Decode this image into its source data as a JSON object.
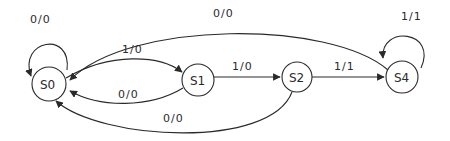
{
  "diagram": {
    "type": "finite-state-machine",
    "states": [
      {
        "id": "S0",
        "label": "S0",
        "cx": 49,
        "cy": 84,
        "r": 17
      },
      {
        "id": "S1",
        "label": "S1",
        "cx": 198,
        "cy": 80,
        "r": 16
      },
      {
        "id": "S2",
        "label": "S2",
        "cx": 297,
        "cy": 77,
        "r": 15
      },
      {
        "id": "S4",
        "label": "S4",
        "cx": 402,
        "cy": 77,
        "r": 16
      }
    ],
    "transitions": [
      {
        "from": "S0",
        "to": "S0",
        "label": "0/0"
      },
      {
        "from": "S0",
        "to": "S1",
        "label": "1/0"
      },
      {
        "from": "S1",
        "to": "S0",
        "label": "0/0"
      },
      {
        "from": "S1",
        "to": "S2",
        "label": "1/0"
      },
      {
        "from": "S2",
        "to": "S4",
        "label": "1/1"
      },
      {
        "from": "S2",
        "to": "S0",
        "label": "0/0"
      },
      {
        "from": "S4",
        "to": "S0",
        "label": "0/0"
      },
      {
        "from": "S4",
        "to": "S4",
        "label": "1/1"
      }
    ]
  }
}
